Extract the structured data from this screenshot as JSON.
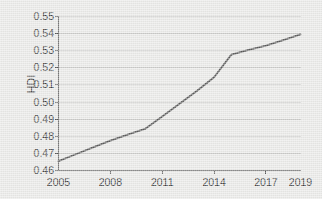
{
  "chart_data": {
    "type": "line",
    "title": "",
    "xlabel": "",
    "ylabel": "HDI",
    "x": [
      2005,
      2006,
      2007,
      2008,
      2009,
      2010,
      2011,
      2012,
      2013,
      2014,
      2015,
      2016,
      2017,
      2018,
      2019
    ],
    "values": [
      0.4655,
      0.4695,
      0.4735,
      0.4775,
      0.481,
      0.4843,
      0.4915,
      0.499,
      0.5065,
      0.5145,
      0.5277,
      0.5305,
      0.533,
      0.5362,
      0.5395
    ],
    "series": [
      {
        "name": "HDI",
        "values": [
          0.4655,
          0.4695,
          0.4735,
          0.4775,
          0.481,
          0.4843,
          0.4915,
          0.499,
          0.5065,
          0.5145,
          0.5277,
          0.5305,
          0.533,
          0.5362,
          0.5395
        ]
      }
    ],
    "xlim": [
      2005,
      2019
    ],
    "ylim": [
      0.46,
      0.55
    ],
    "yticks": [
      0.46,
      0.47,
      0.48,
      0.49,
      0.5,
      0.51,
      0.52,
      0.53,
      0.54,
      0.55
    ],
    "ytick_labels": [
      "0.46",
      "0.47",
      "0.48",
      "0.49",
      "0.50",
      "0.51",
      "0.52",
      "0.53",
      "0.54",
      "0.55"
    ],
    "xticks": [
      2005,
      2008,
      2011,
      2014,
      2017,
      2019
    ],
    "xtick_labels": [
      "2005",
      "2008",
      "2011",
      "2014",
      "2017",
      "2019"
    ],
    "grid": "horizontal",
    "legend": "none",
    "line_color": "#595959",
    "grid_color": "#c9c9c7",
    "axis_color": "#595959",
    "plot_background": "#e9e9e7",
    "text_color": "#3b3b3b"
  }
}
